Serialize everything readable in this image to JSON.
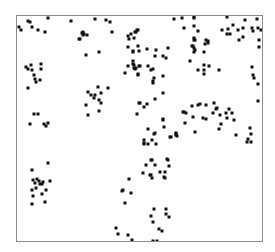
{
  "chart_data": {
    "type": "scatter",
    "title": "",
    "xlabel": "",
    "ylabel": "",
    "axes_visible": false,
    "ticks_visible": false,
    "grid": false,
    "legend": null,
    "frame": true,
    "coordinate_note": "pixel positions inside plot frame (x 0-246 left-to-right, y 0-226 top-to-bottom)",
    "xlim": [
      0,
      246
    ],
    "ylim": [
      0,
      226
    ],
    "marker": {
      "shape": "square",
      "size": 3,
      "color": "#111111"
    },
    "frame_color": "#8a8a8a",
    "points": [
      [
        2,
        11
      ],
      [
        4,
        14
      ],
      [
        11,
        5
      ],
      [
        13,
        6
      ],
      [
        15,
        11
      ],
      [
        21,
        14
      ],
      [
        28,
        16
      ],
      [
        31,
        2
      ],
      [
        54,
        5
      ],
      [
        63,
        23
      ],
      [
        65,
        17
      ],
      [
        66,
        19
      ],
      [
        9,
        51
      ],
      [
        11,
        53
      ],
      [
        14,
        49
      ],
      [
        15,
        54
      ],
      [
        17,
        59
      ],
      [
        18,
        63
      ],
      [
        19,
        66
      ],
      [
        24,
        48
      ],
      [
        24,
        53
      ],
      [
        23,
        64
      ],
      [
        11,
        72
      ],
      [
        17,
        98
      ],
      [
        21,
        98
      ],
      [
        13,
        108
      ],
      [
        27,
        108
      ],
      [
        29,
        110
      ],
      [
        31,
        107
      ],
      [
        31,
        147
      ],
      [
        15,
        154
      ],
      [
        16,
        164
      ],
      [
        18,
        167
      ],
      [
        20,
        163
      ],
      [
        22,
        165
      ],
      [
        23,
        168
      ],
      [
        25,
        168
      ],
      [
        26,
        166
      ],
      [
        33,
        165
      ],
      [
        15,
        174
      ],
      [
        19,
        172
      ],
      [
        25,
        178
      ],
      [
        29,
        174
      ],
      [
        16,
        180
      ],
      [
        15,
        188
      ],
      [
        28,
        186
      ],
      [
        78,
        3
      ],
      [
        89,
        4
      ],
      [
        93,
        6
      ],
      [
        66,
        16
      ],
      [
        67,
        18
      ],
      [
        70,
        19
      ],
      [
        62,
        23
      ],
      [
        95,
        16
      ],
      [
        111,
        20
      ],
      [
        114,
        18
      ],
      [
        119,
        16
      ],
      [
        121,
        14
      ],
      [
        112,
        23
      ],
      [
        117,
        22
      ],
      [
        69,
        39
      ],
      [
        82,
        36
      ],
      [
        111,
        31
      ],
      [
        116,
        36
      ],
      [
        121,
        30
      ],
      [
        122,
        35
      ],
      [
        116,
        45
      ],
      [
        117,
        49
      ],
      [
        111,
        50
      ],
      [
        119,
        52
      ],
      [
        122,
        50
      ],
      [
        108,
        57
      ],
      [
        121,
        59
      ],
      [
        81,
        71
      ],
      [
        91,
        72
      ],
      [
        71,
        76
      ],
      [
        74,
        79
      ],
      [
        78,
        79
      ],
      [
        77,
        82
      ],
      [
        84,
        77
      ],
      [
        82,
        84
      ],
      [
        84,
        87
      ],
      [
        69,
        89
      ],
      [
        71,
        99
      ],
      [
        82,
        95
      ],
      [
        122,
        87
      ],
      [
        120,
        98
      ],
      [
        157,
        3
      ],
      [
        165,
        2
      ],
      [
        177,
        2
      ],
      [
        167,
        12
      ],
      [
        177,
        10
      ],
      [
        181,
        15
      ],
      [
        177,
        22
      ],
      [
        178,
        24
      ],
      [
        118,
        16
      ],
      [
        120,
        14
      ],
      [
        121,
        30
      ],
      [
        122,
        35
      ],
      [
        130,
        33
      ],
      [
        116,
        35
      ],
      [
        139,
        34
      ],
      [
        151,
        32
      ],
      [
        138,
        40
      ],
      [
        146,
        40
      ],
      [
        149,
        42
      ],
      [
        175,
        30
      ],
      [
        177,
        32
      ],
      [
        177,
        36
      ],
      [
        173,
        45
      ],
      [
        116,
        45
      ],
      [
        117,
        49
      ],
      [
        118,
        53
      ],
      [
        123,
        50
      ],
      [
        131,
        50
      ],
      [
        134,
        54
      ],
      [
        121,
        59
      ],
      [
        137,
        62
      ],
      [
        146,
        60
      ],
      [
        136,
        65
      ],
      [
        181,
        54
      ],
      [
        177,
        1
      ],
      [
        210,
        1
      ],
      [
        228,
        4
      ],
      [
        240,
        3
      ],
      [
        177,
        10
      ],
      [
        181,
        15
      ],
      [
        205,
        14
      ],
      [
        211,
        13
      ],
      [
        216,
        9
      ],
      [
        210,
        18
      ],
      [
        213,
        18
      ],
      [
        221,
        14
      ],
      [
        226,
        12
      ],
      [
        235,
        12
      ],
      [
        241,
        12
      ],
      [
        244,
        14
      ],
      [
        236,
        15
      ],
      [
        226,
        21
      ],
      [
        222,
        24
      ],
      [
        242,
        24
      ],
      [
        242,
        31
      ],
      [
        177,
        22
      ],
      [
        177,
        24
      ],
      [
        189,
        24
      ],
      [
        191,
        25
      ],
      [
        191,
        27
      ],
      [
        188,
        28
      ],
      [
        176,
        30
      ],
      [
        178,
        34
      ],
      [
        187,
        36
      ],
      [
        187,
        49
      ],
      [
        192,
        50
      ],
      [
        187,
        54
      ],
      [
        181,
        54
      ],
      [
        187,
        58
      ],
      [
        202,
        54
      ],
      [
        235,
        51
      ],
      [
        236,
        59
      ],
      [
        237,
        62
      ],
      [
        241,
        68
      ],
      [
        241,
        85
      ],
      [
        146,
        103
      ],
      [
        147,
        111
      ],
      [
        166,
        96
      ],
      [
        169,
        97
      ],
      [
        175,
        90
      ],
      [
        181,
        89
      ],
      [
        183,
        88
      ],
      [
        189,
        89
      ],
      [
        197,
        87
      ],
      [
        199,
        93
      ],
      [
        200,
        92
      ],
      [
        196,
        97
      ],
      [
        176,
        101
      ],
      [
        186,
        102
      ],
      [
        189,
        103
      ],
      [
        168,
        107
      ],
      [
        203,
        99
      ],
      [
        209,
        97
      ],
      [
        212,
        93
      ],
      [
        215,
        97
      ],
      [
        210,
        102
      ],
      [
        217,
        104
      ],
      [
        204,
        108
      ],
      [
        202,
        113
      ],
      [
        154,
        121
      ],
      [
        159,
        119
      ],
      [
        159,
        117
      ],
      [
        178,
        116
      ],
      [
        219,
        119
      ],
      [
        233,
        112
      ],
      [
        234,
        118
      ],
      [
        231,
        123
      ],
      [
        230,
        126
      ],
      [
        234,
        126
      ],
      [
        116,
        48
      ],
      [
        117,
        52
      ],
      [
        122,
        50
      ],
      [
        131,
        50
      ],
      [
        136,
        53
      ],
      [
        121,
        58
      ],
      [
        137,
        62
      ],
      [
        146,
        60
      ],
      [
        136,
        67
      ],
      [
        146,
        77
      ],
      [
        138,
        83
      ],
      [
        123,
        87
      ],
      [
        130,
        88
      ],
      [
        127,
        91
      ],
      [
        120,
        98
      ],
      [
        167,
        96
      ],
      [
        169,
        97
      ],
      [
        146,
        104
      ],
      [
        147,
        111
      ],
      [
        168,
        107
      ],
      [
        131,
        113
      ],
      [
        138,
        117
      ],
      [
        153,
        121
      ],
      [
        159,
        118
      ],
      [
        160,
        120
      ],
      [
        127,
        124
      ],
      [
        135,
        124
      ],
      [
        137,
        118
      ],
      [
        154,
        121
      ],
      [
        159,
        119
      ],
      [
        135,
        124
      ],
      [
        127,
        127
      ],
      [
        131,
        128
      ],
      [
        127,
        128
      ],
      [
        139,
        128
      ],
      [
        134,
        144
      ],
      [
        150,
        143
      ],
      [
        129,
        149
      ],
      [
        138,
        149
      ],
      [
        152,
        150
      ],
      [
        126,
        157
      ],
      [
        133,
        159
      ],
      [
        135,
        162
      ],
      [
        143,
        156
      ],
      [
        148,
        156
      ],
      [
        148,
        162
      ],
      [
        112,
        163
      ],
      [
        106,
        174
      ],
      [
        127,
        128
      ],
      [
        131,
        128
      ],
      [
        139,
        128
      ],
      [
        135,
        144
      ],
      [
        129,
        149
      ],
      [
        151,
        144
      ],
      [
        152,
        150
      ],
      [
        126,
        157
      ],
      [
        134,
        159
      ],
      [
        135,
        162
      ],
      [
        143,
        156
      ],
      [
        148,
        156
      ],
      [
        147,
        161
      ],
      [
        112,
        163
      ],
      [
        105,
        175
      ],
      [
        114,
        177
      ],
      [
        108,
        187
      ],
      [
        137,
        193
      ],
      [
        149,
        193
      ],
      [
        134,
        200
      ],
      [
        149,
        198
      ],
      [
        152,
        201
      ],
      [
        136,
        206
      ],
      [
        99,
        212
      ],
      [
        101,
        218
      ],
      [
        111,
        219
      ],
      [
        115,
        224
      ],
      [
        142,
        213
      ],
      [
        145,
        215
      ],
      [
        136,
        225
      ],
      [
        140,
        225
      ]
    ]
  }
}
